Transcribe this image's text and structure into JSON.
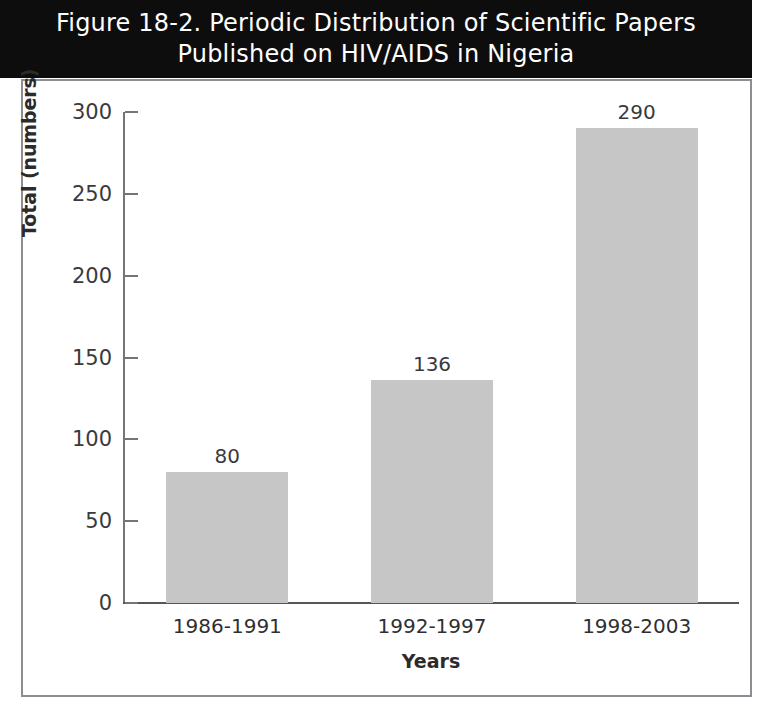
{
  "figure": {
    "title_lines": [
      "Figure 18-2. Periodic Distribution of Scientific Papers",
      "Published on HIV/AIDS in Nigeria"
    ],
    "title_background": "#0d0d0d",
    "title_color": "#ffffff",
    "frame_color": "#8d8d93",
    "bar_color": "#c6c6c6",
    "axis_color": "#74747a"
  },
  "chart_data": {
    "type": "bar",
    "title": "Figure 18-2. Periodic Distribution of Scientific Papers Published on HIV/AIDS in Nigeria",
    "subtitle": "",
    "categories": [
      "1986-1991",
      "1992-1997",
      "1998-2003"
    ],
    "values": [
      80,
      136,
      290
    ],
    "value_labels": [
      "80",
      "136",
      "290"
    ],
    "xlabel": "Years",
    "ylabel": "Total (numbers)",
    "ylim": [
      0,
      300
    ],
    "yticks": [
      0,
      50,
      100,
      150,
      200,
      250,
      300
    ],
    "ytick_labels": [
      "0",
      "50",
      "100",
      "150",
      "200",
      "250",
      "300"
    ],
    "grid": false,
    "legend": false,
    "legend_position": "none",
    "series": [
      {
        "name": "Total (numbers)",
        "values": [
          80,
          136,
          290
        ]
      }
    ]
  }
}
